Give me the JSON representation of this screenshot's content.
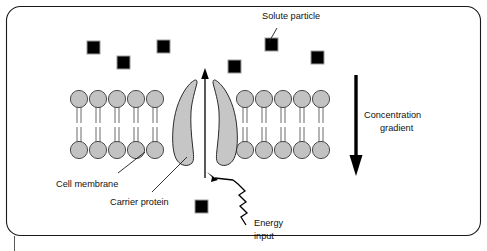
{
  "figure": {
    "title_alt": "Active transport across a cell membrane",
    "border_color": "#000000",
    "background": "#ffffff"
  },
  "labels": {
    "solute_particle": "Solute particle",
    "concentration_gradient_line1": "Concentration",
    "concentration_gradient_line2": "gradient",
    "cell_membrane": "Cell membrane",
    "carrier_protein": "Carrier protein",
    "energy_line1": "Energy",
    "energy_line2": "input"
  },
  "colors": {
    "lipid_head_fill": "#c2c2c2",
    "lipid_head_stroke": "#3a3a3a",
    "protein_fill": "#c6c6c6",
    "protein_stroke": "#2b2b2b",
    "solute_fill": "#000000",
    "solute_stroke": "#9a9a9a",
    "text": "#111111",
    "arrow": "#000000"
  },
  "solute_particles": [
    {
      "id": "solute-1",
      "x": 87,
      "y": 41,
      "size": 13
    },
    {
      "id": "solute-2",
      "x": 117,
      "y": 56,
      "size": 13
    },
    {
      "id": "solute-3",
      "x": 157,
      "y": 40,
      "size": 13
    },
    {
      "id": "solute-4",
      "x": 228,
      "y": 60,
      "size": 13
    },
    {
      "id": "solute-5",
      "x": 265,
      "y": 38,
      "size": 13
    },
    {
      "id": "solute-6",
      "x": 311,
      "y": 51,
      "size": 13
    },
    {
      "id": "solute-7",
      "x": 195,
      "y": 200,
      "size": 13
    }
  ],
  "membrane": {
    "left_leaflet_count": 5,
    "right_leaflet_count": 5,
    "head_radius": 8.5,
    "upper_head_cy": 99,
    "lower_head_cy": 150,
    "left_start_x": 79,
    "right_start_x": 245,
    "head_spacing": 19
  },
  "transport_arrow": {
    "direction": "up",
    "x": 205,
    "y_top": 70,
    "y_bottom": 178
  },
  "gradient_arrow": {
    "direction": "down",
    "x": 356,
    "y_top": 75,
    "y_bottom": 172
  }
}
